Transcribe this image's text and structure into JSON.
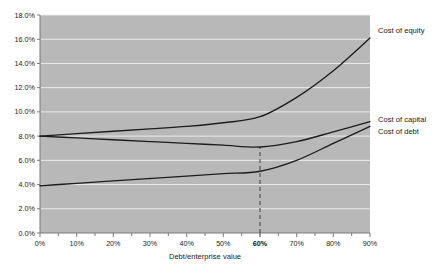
{
  "chart_data": {
    "type": "line",
    "title": "",
    "xlabel": "Debt/enterprise value",
    "ylabel": "",
    "x": [
      0,
      10,
      20,
      30,
      40,
      50,
      60,
      70,
      80,
      90
    ],
    "xtick_labels": [
      "0%",
      "10%",
      "20%",
      "30%",
      "40%",
      "50%",
      "60%",
      "70%",
      "80%",
      "90%"
    ],
    "xtick_highlight": "60%",
    "ytick_labels": [
      "0.0%",
      "2.0%",
      "4.0%",
      "6.0%",
      "8.0%",
      "10.0%",
      "12.0%",
      "14.0%",
      "16.0%",
      "18.0%"
    ],
    "ytick_values": [
      0,
      2,
      4,
      6,
      8,
      10,
      12,
      14,
      16,
      18
    ],
    "xlim": [
      0,
      90
    ],
    "ylim": [
      0,
      18
    ],
    "grid": true,
    "legend_position": "right-inline",
    "series": [
      {
        "name": "Cost of equity",
        "label": "Cost of equity",
        "values": [
          8.0,
          8.2,
          8.4,
          8.6,
          8.8,
          9.1,
          9.6,
          11.2,
          13.4,
          16.1
        ]
      },
      {
        "name": "Cost of capital",
        "label": "Cost of capital",
        "values": [
          8.0,
          7.85,
          7.7,
          7.55,
          7.4,
          7.25,
          7.1,
          7.55,
          8.35,
          9.2
        ]
      },
      {
        "name": "Cost of debt",
        "label": "Cost of debt",
        "values": [
          3.9,
          4.1,
          4.3,
          4.5,
          4.7,
          4.9,
          5.1,
          6.0,
          7.4,
          8.8
        ]
      }
    ],
    "annotations": [
      {
        "name": "optimal-capital-structure-marker",
        "type": "vertical-dashed-line",
        "x": 60,
        "y_from": 0,
        "y_to": 7.1,
        "label": "60%"
      }
    ],
    "colors": {
      "plot_background": "#b8b8b8",
      "gridline": "#ececec",
      "line": "#1c1c1c",
      "marker": "#4a4a4a",
      "text": "#222222"
    }
  }
}
